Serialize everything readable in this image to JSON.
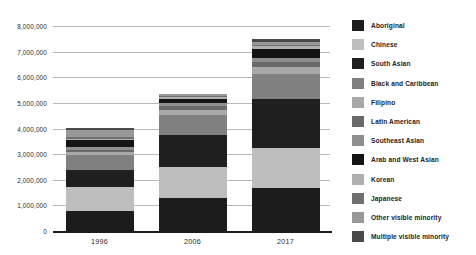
{
  "chart_data": {
    "type": "bar",
    "subtype": "stacked-bar",
    "title": "",
    "xlabel": "",
    "ylabel": "",
    "categories": [
      "1996",
      "2006",
      "2017"
    ],
    "ylim": [
      0,
      8000000
    ],
    "y_ticks": [
      0,
      1000000,
      2000000,
      3000000,
      4000000,
      5000000,
      6000000,
      7000000,
      8000000
    ],
    "y_tick_labels": [
      "0",
      "1,000,000",
      "2,000,000",
      "3,000,000",
      "4,000,000",
      "5,000,000",
      "6,000,000",
      "7,000,000",
      "8,000,000"
    ],
    "grid": true,
    "grid_axis": "y",
    "legend_position": "right",
    "totals": [
      4010000,
      5350000,
      6950000
    ],
    "series": [
      {
        "name": "Aboriginal",
        "color": "#1c1c1c",
        "values": [
          800000,
          1270000,
          1670000
        ]
      },
      {
        "name": "Chinese",
        "color": "#bebebe",
        "values": [
          920000,
          1220000,
          1580000
        ]
      },
      {
        "name": "South Asian",
        "color": "#1f1f1f",
        "values": [
          670000,
          1270000,
          1920000
        ]
      },
      {
        "name": "Black and Caribbean",
        "color": "#808080",
        "values": [
          570000,
          780000,
          950000
        ]
      },
      {
        "name": "Filipino",
        "color": "#a8a8a8",
        "values": [
          110000,
          180000,
          280000
        ]
      },
      {
        "name": "Latin American",
        "color": "#6a6a6a",
        "values": [
          100000,
          160000,
          200000
        ]
      },
      {
        "name": "Southeast Asian",
        "color": "#8f8f8f",
        "values": [
          95000,
          130000,
          160000
        ]
      },
      {
        "name": "Arab and West Asian",
        "color": "#141414",
        "values": [
          270000,
          160000,
          350000
        ]
      },
      {
        "name": "Korean",
        "color": "#b0b0b0",
        "values": [
          60000,
          80000,
          110000
        ]
      },
      {
        "name": "Japanese",
        "color": "#707070",
        "values": [
          60000,
          40000,
          60000
        ]
      },
      {
        "name": "Other visible minority",
        "color": "#989898",
        "values": [
          300000,
          50000,
          90000
        ]
      },
      {
        "name": "Multiple visible minority",
        "color": "#4a4a4a",
        "values": [
          55000,
          10000,
          130000
        ]
      }
    ]
  },
  "axes": {
    "baseline_color": "#1c1c1c",
    "gridline_color": "#b9b9b9"
  }
}
